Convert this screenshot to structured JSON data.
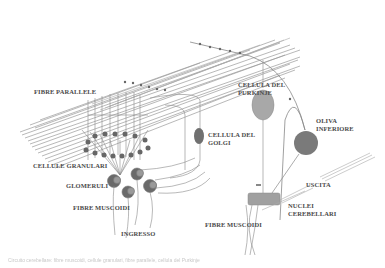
{
  "diagram": {
    "type": "cerebellar circuit schematic",
    "colors": {
      "fiber": "#9a9a9a",
      "cell_fill": "#8a8a8a",
      "purkinje_fill": "#a8a8a8",
      "olive_fill": "#7a7a7a",
      "nucleus_fill": "#a0a0a0",
      "label": "#4a4a4a"
    },
    "labels": {
      "parallel_fibers": "FIBRE PARALLELE",
      "purkinje_line1": "CELLULA DEL",
      "purkinje_line2": "PURKINJE",
      "olive_line1": "OLIVA",
      "olive_line2": "INFERIORE",
      "golgi_line1": "CELLULA DEL",
      "golgi_line2": "GOLGI",
      "granule_cells": "CELLULE GRANULARI",
      "glomeruli": "GLOMERULI",
      "mossy_fibers_left": "FIBRE MUSCOIDI",
      "input": "INGRESSO",
      "output": "USCITA",
      "nuclei_line1": "NUCLEI",
      "nuclei_line2": "CEREBELLARI",
      "mossy_fibers_right": "FIBRE MUSCOIDI"
    },
    "caption": "Circuito cerebellare: fibre muscoidi, cellule granulari, fibre parallele, cellula del Purkinje"
  }
}
